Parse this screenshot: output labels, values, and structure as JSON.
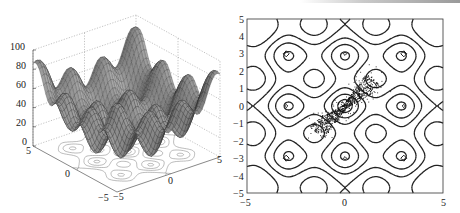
{
  "chart_data": [
    {
      "type": "surface3d",
      "title": "",
      "function": "f(x,y) = x^2 + y^2 + 10*(2 - cos(2*pi*x/3) - cos(2*pi*y/3)) scaled (multimodal, peaks near corners ~100)",
      "x_range": [
        -5,
        5
      ],
      "y_range": [
        -5,
        5
      ],
      "z_range": [
        0,
        100
      ],
      "z_ticks": [
        "0",
        "20",
        "40",
        "60",
        "80",
        "100"
      ],
      "x_ticks": [
        "-5",
        "0",
        "5"
      ],
      "y_ticks": [
        "-5",
        "0",
        "5"
      ],
      "floor_contours": true,
      "grid": true
    },
    {
      "type": "contour",
      "title": "",
      "x_range": [
        -5,
        5
      ],
      "y_range": [
        -5,
        5
      ],
      "x_ticks": [
        "-5",
        "0",
        "5"
      ],
      "y_ticks": [
        "-5",
        "-4",
        "-3",
        "-2",
        "-1",
        "0",
        "1",
        "2",
        "3",
        "4",
        "5"
      ],
      "minima_markers": [
        [
          -3,
          3
        ],
        [
          0,
          3
        ],
        [
          3,
          3
        ],
        [
          -3,
          0
        ],
        [
          3,
          0
        ],
        [
          -3,
          -3
        ],
        [
          0,
          -3
        ],
        [
          3,
          -3
        ]
      ],
      "scatter_cloud": {
        "center": [
          0,
          0
        ],
        "orientation": "diagonal x=y",
        "extent": [
          [
            -2,
            -2
          ],
          [
            2,
            1.5
          ]
        ],
        "description": "dense cloud of sample points around origin forming an X/bow-tie along diagonal"
      }
    }
  ],
  "left": {
    "z_labels": [
      "100",
      "80",
      "60",
      "40",
      "20",
      "0"
    ],
    "x_labels": [
      "5",
      "0",
      "-5"
    ],
    "y_labels": [
      "-5",
      "0",
      "5"
    ]
  },
  "right": {
    "y_labels": [
      "5",
      "4",
      "3",
      "2",
      "1",
      "0",
      "-1",
      "-2",
      "-3",
      "-4",
      "-5"
    ],
    "x_labels": [
      "-5",
      "0",
      "5"
    ]
  },
  "colors": {
    "surface_dark": "#3a3a3a",
    "surface_light": "#9a9a9a",
    "contour_line": "#222222",
    "floor_contour": "#777777",
    "grid": "#9a9a9a"
  }
}
